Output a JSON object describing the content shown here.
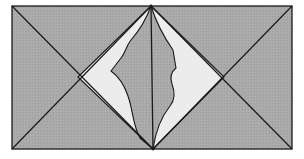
{
  "diagram": {
    "width": 304,
    "height": 159,
    "colors": {
      "background": "#ffffff",
      "panel_fill": "#a9a9a9",
      "highlight_fill": "#ececec",
      "stroke": "#1a1a1a"
    },
    "panel": {
      "x": 12,
      "y": 6,
      "width": 280,
      "height": 143
    },
    "apex_top": [
      151,
      6
    ],
    "apex_bottom": [
      153,
      149
    ],
    "left_cross": [
      78,
      77
    ],
    "right_cross": [
      224,
      77
    ],
    "shapes": [
      {
        "name": "left-curved-shape",
        "path": "M151,6 C146,20 138,32 131,40 C126,46 126,52 121,58 L111,71 C118,76 124,84 128,96 C133,110 133,126 140,138 L153,149 L78,77 Z"
      },
      {
        "name": "right-curved-shape",
        "path": "M151,6 C156,22 166,40 173,50 L176,68 C171,72 170,78 172,84 C175,92 175,100 170,106 C162,116 156,128 153,149 L224,77 Z"
      }
    ]
  }
}
